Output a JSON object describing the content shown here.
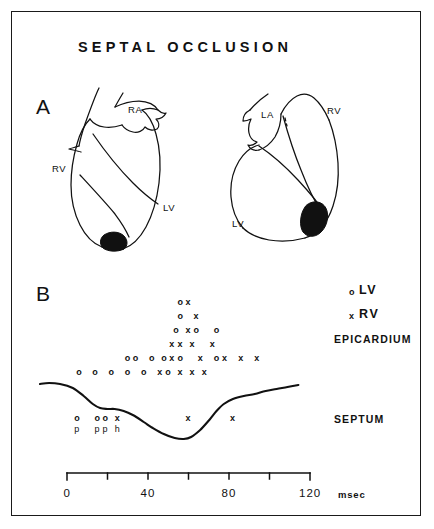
{
  "figure": {
    "title": "SEPTAL OCCLUSION",
    "panel_a_letter": "A",
    "panel_b_letter": "B"
  },
  "panel_a": {
    "left_heart": {
      "labels": [
        {
          "text": "RA",
          "x": 128,
          "y": 110
        },
        {
          "text": "RV",
          "x": 54,
          "y": 168
        },
        {
          "text": "LV",
          "x": 165,
          "y": 208
        }
      ],
      "infarct": "black-apical-region"
    },
    "right_heart": {
      "labels": [
        {
          "text": "LA",
          "x": 263,
          "y": 114
        },
        {
          "text": "RV",
          "x": 329,
          "y": 110
        },
        {
          "text": "LV",
          "x": 234,
          "y": 223
        }
      ],
      "infarct": "black-apical-region"
    }
  },
  "panel_b": {
    "legend": [
      {
        "mark": "o",
        "label": "LV"
      },
      {
        "mark": "x",
        "label": "RV"
      }
    ],
    "row_labels": [
      {
        "text": "EPICARDIUM",
        "y": 338
      },
      {
        "text": "SEPTUM",
        "y": 418
      }
    ]
  },
  "chart_data": {
    "type": "scatter",
    "title": "SEPTAL OCCLUSION",
    "xlabel": "msec",
    "ylabel": "",
    "xlim": [
      0,
      120
    ],
    "xticks": [
      0,
      20,
      40,
      60,
      80,
      100,
      120
    ],
    "xticklabels": [
      "0",
      "",
      "40",
      "",
      "80",
      "",
      "120"
    ],
    "unit": "msec",
    "grid": false,
    "legend_position": "top-right",
    "series": [
      {
        "name": "LV",
        "marker": "o"
      },
      {
        "name": "RV",
        "marker": "x"
      }
    ],
    "groups": [
      {
        "name": "EPICARDIUM",
        "rows": [
          {
            "row": 1,
            "points": [
              {
                "t": 56,
                "m": "o"
              },
              {
                "t": 60,
                "m": "x"
              }
            ]
          },
          {
            "row": 2,
            "points": [
              {
                "t": 56,
                "m": "o"
              },
              {
                "t": 64,
                "m": "x"
              }
            ]
          },
          {
            "row": 3,
            "points": [
              {
                "t": 54,
                "m": "o"
              },
              {
                "t": 60,
                "m": "x"
              },
              {
                "t": 64,
                "m": "o"
              },
              {
                "t": 74,
                "m": "o"
              }
            ]
          },
          {
            "row": 4,
            "points": [
              {
                "t": 52,
                "m": "x"
              },
              {
                "t": 56,
                "m": "x"
              },
              {
                "t": 62,
                "m": "x"
              },
              {
                "t": 72,
                "m": "x"
              }
            ]
          },
          {
            "row": 5,
            "points": [
              {
                "t": 30,
                "m": "o"
              },
              {
                "t": 34,
                "m": "o"
              },
              {
                "t": 42,
                "m": "o"
              },
              {
                "t": 48,
                "m": "o"
              },
              {
                "t": 52,
                "m": "x"
              },
              {
                "t": 56,
                "m": "o"
              },
              {
                "t": 66,
                "m": "x"
              },
              {
                "t": 74,
                "m": "o"
              },
              {
                "t": 78,
                "m": "x"
              },
              {
                "t": 86,
                "m": "x"
              },
              {
                "t": 94,
                "m": "x"
              }
            ]
          },
          {
            "row": 6,
            "points": [
              {
                "t": 6,
                "m": "o"
              },
              {
                "t": 14,
                "m": "o"
              },
              {
                "t": 22,
                "m": "o"
              },
              {
                "t": 30,
                "m": "o"
              },
              {
                "t": 38,
                "m": "o"
              },
              {
                "t": 46,
                "m": "x"
              },
              {
                "t": 50,
                "m": "o"
              },
              {
                "t": 56,
                "m": "x"
              },
              {
                "t": 62,
                "m": "x"
              },
              {
                "t": 68,
                "m": "x"
              }
            ]
          }
        ]
      },
      {
        "name": "SEPTUM",
        "rows": [
          {
            "row": 1,
            "points": [
              {
                "t": 5,
                "m": "o",
                "sub": "p"
              },
              {
                "t": 15,
                "m": "o",
                "sub": "p"
              },
              {
                "t": 19,
                "m": "o",
                "sub": "p"
              },
              {
                "t": 25,
                "m": "x",
                "sub": "h"
              },
              {
                "t": 60,
                "m": "x",
                "sub": ""
              },
              {
                "t": 82,
                "m": "x",
                "sub": ""
              }
            ]
          }
        ]
      }
    ],
    "septal_motion_curve": {
      "description": "septal wall motion trace, baseline flat then downward dip with minimum near 45 msec then recovery",
      "points": [
        [
          0,
          384
        ],
        [
          5,
          383
        ],
        [
          11,
          384
        ],
        [
          18,
          388
        ],
        [
          24,
          396
        ],
        [
          29,
          404
        ],
        [
          33,
          408
        ],
        [
          37,
          409
        ],
        [
          41,
          409
        ],
        [
          46,
          411
        ],
        [
          51,
          415
        ],
        [
          57,
          422
        ],
        [
          62,
          428
        ],
        [
          68,
          434
        ],
        [
          74,
          438
        ],
        [
          79,
          439
        ],
        [
          83,
          437
        ],
        [
          88,
          430
        ],
        [
          93,
          420
        ],
        [
          97,
          411
        ],
        [
          101,
          404
        ],
        [
          106,
          399
        ],
        [
          112,
          396
        ],
        [
          118,
          394
        ],
        [
          124,
          391
        ],
        [
          130,
          389
        ],
        [
          136,
          387
        ],
        [
          142,
          385
        ]
      ]
    }
  }
}
